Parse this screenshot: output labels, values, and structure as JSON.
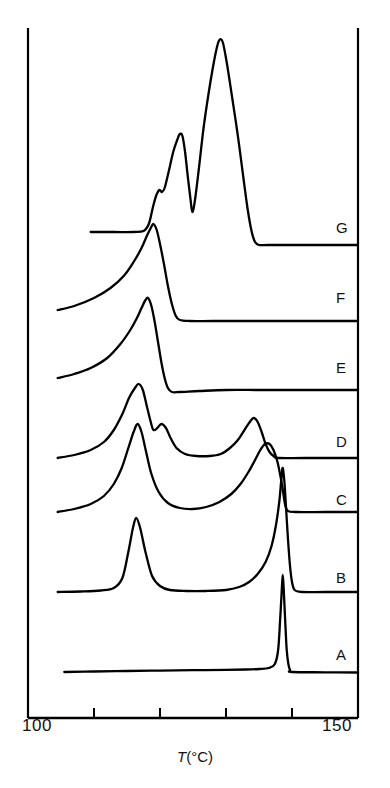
{
  "chart_data": {
    "type": "line",
    "title": "",
    "subtitle": "",
    "xlabel": "T(°C)",
    "xlabel_symbol": "T",
    "xlabel_units": "(°C)",
    "ylabel": "",
    "xlim": [
      100,
      150
    ],
    "ylim": [
      0,
      1
    ],
    "grid": false,
    "legend_position": "right-inline",
    "xticks": [
      100,
      110,
      120,
      130,
      140,
      150
    ],
    "xtick_labels": [
      "100",
      "",
      "",
      "",
      "",
      "150"
    ],
    "axis_style": "open-frame-left-right-bottom",
    "line_color": "#000000",
    "background_color": "#ffffff",
    "annotations": [
      "A",
      "B",
      "C",
      "D",
      "E",
      "F",
      "G"
    ],
    "series": [
      {
        "name": "A",
        "label": "A",
        "baseline_y": 672,
        "label_y": 655,
        "description": "flat baseline with single very sharp endothermic peak near 139 °C",
        "points": [
          [
            105.5,
            672
          ],
          [
            110,
            671.5
          ],
          [
            115,
            671
          ],
          [
            120,
            670.6
          ],
          [
            125,
            670.2
          ],
          [
            130,
            669.8
          ],
          [
            133,
            669.5
          ],
          [
            135,
            669.0
          ],
          [
            136.5,
            668.0
          ],
          [
            137.4,
            664.0
          ],
          [
            137.9,
            650.0
          ],
          [
            138.2,
            620.0
          ],
          [
            138.45,
            590.0
          ],
          [
            138.6,
            575.0
          ],
          [
            138.75,
            590.0
          ],
          [
            139.0,
            625.0
          ],
          [
            139.2,
            650.0
          ],
          [
            139.45,
            664.0
          ],
          [
            139.7,
            670.0
          ],
          [
            140.0,
            672.0
          ],
          [
            145,
            672.3
          ],
          [
            150,
            672.5
          ]
        ]
      },
      {
        "name": "B",
        "label": "B",
        "baseline_y": 592,
        "label_y": 578,
        "description": "broad small peak near 116 °C then rising shoulder to sharp peak near 139 °C",
        "points": [
          [
            104.5,
            592
          ],
          [
            108,
            591.5
          ],
          [
            111,
            590.5
          ],
          [
            113,
            588
          ],
          [
            114.3,
            578
          ],
          [
            115.2,
            552
          ],
          [
            115.9,
            528
          ],
          [
            116.4,
            518
          ],
          [
            117.0,
            528
          ],
          [
            117.8,
            552
          ],
          [
            118.8,
            576
          ],
          [
            120,
            586
          ],
          [
            121.5,
            590
          ],
          [
            124,
            591
          ],
          [
            127,
            591
          ],
          [
            130,
            590
          ],
          [
            132,
            587
          ],
          [
            133.5,
            582
          ],
          [
            134.8,
            574
          ],
          [
            136,
            562
          ],
          [
            136.9,
            546
          ],
          [
            137.6,
            524
          ],
          [
            138.1,
            500
          ],
          [
            138.4,
            478
          ],
          [
            138.6,
            468
          ],
          [
            138.85,
            482
          ],
          [
            139.1,
            508
          ],
          [
            139.4,
            540
          ],
          [
            139.7,
            566
          ],
          [
            140.0,
            582
          ],
          [
            140.4,
            590
          ],
          [
            141.5,
            592
          ],
          [
            145,
            592
          ],
          [
            150,
            592
          ]
        ]
      },
      {
        "name": "C",
        "label": "C",
        "baseline_y": 512,
        "label_y": 500,
        "description": "broad asymmetric endotherm near 117 °C with long tail then very sharp peak near 139 °C",
        "points": [
          [
            104.5,
            512
          ],
          [
            107,
            509
          ],
          [
            109.5,
            504
          ],
          [
            111.5,
            496
          ],
          [
            113,
            484
          ],
          [
            114.2,
            468
          ],
          [
            115.2,
            448
          ],
          [
            116.0,
            432
          ],
          [
            116.6,
            424
          ],
          [
            117.2,
            432
          ],
          [
            117.9,
            452
          ],
          [
            118.7,
            474
          ],
          [
            119.8,
            492
          ],
          [
            121.2,
            503
          ],
          [
            123,
            508
          ],
          [
            125,
            509
          ],
          [
            127,
            507
          ],
          [
            129,
            502
          ],
          [
            130.8,
            494
          ],
          [
            132.2,
            484
          ],
          [
            133.4,
            472
          ],
          [
            134.4,
            460
          ],
          [
            135.2,
            450
          ],
          [
            135.9,
            444
          ],
          [
            136.6,
            444
          ],
          [
            137.2,
            450
          ],
          [
            137.8,
            462
          ],
          [
            138.3,
            478
          ],
          [
            138.7,
            494
          ],
          [
            139.0,
            506
          ],
          [
            139.4,
            511
          ],
          [
            140.5,
            512
          ],
          [
            145,
            512
          ],
          [
            150,
            512
          ]
        ]
      },
      {
        "name": "D",
        "label": "D",
        "baseline_y": 458,
        "label_y": 442,
        "description": "sharp main peak near 117 °C with secondary shoulder near 120 °C and broad peak near 133 °C",
        "points": [
          [
            104.5,
            458
          ],
          [
            107,
            455
          ],
          [
            109.5,
            450
          ],
          [
            111.5,
            442
          ],
          [
            113,
            430
          ],
          [
            114.3,
            414
          ],
          [
            115.3,
            398
          ],
          [
            116.2,
            388
          ],
          [
            116.8,
            384
          ],
          [
            117.4,
            390
          ],
          [
            118.0,
            406
          ],
          [
            118.6,
            422
          ],
          [
            119.0,
            430
          ],
          [
            119.6,
            428
          ],
          [
            120.2,
            424
          ],
          [
            120.9,
            428
          ],
          [
            121.6,
            438
          ],
          [
            122.5,
            448
          ],
          [
            123.8,
            454
          ],
          [
            125.5,
            456
          ],
          [
            127.5,
            456
          ],
          [
            129.2,
            454
          ],
          [
            130.6,
            448
          ],
          [
            131.8,
            440
          ],
          [
            132.8,
            430
          ],
          [
            133.6,
            422
          ],
          [
            134.2,
            418
          ],
          [
            134.8,
            422
          ],
          [
            135.4,
            432
          ],
          [
            136.0,
            444
          ],
          [
            136.6,
            452
          ],
          [
            137.2,
            456
          ],
          [
            138,
            458
          ],
          [
            142,
            458
          ],
          [
            150,
            458
          ]
        ]
      },
      {
        "name": "E",
        "label": "E",
        "baseline_y": 378,
        "label_y": 368,
        "description": "broad leading edge rising to sharp peak near 118 °C then sharp drop to flat baseline",
        "points": [
          [
            104.5,
            378
          ],
          [
            107,
            374
          ],
          [
            109.5,
            368
          ],
          [
            112,
            358
          ],
          [
            114,
            344
          ],
          [
            115.5,
            330
          ],
          [
            116.5,
            318
          ],
          [
            117.2,
            308
          ],
          [
            117.8,
            300
          ],
          [
            118.2,
            298
          ],
          [
            118.7,
            306
          ],
          [
            119.2,
            322
          ],
          [
            119.7,
            342
          ],
          [
            120.2,
            362
          ],
          [
            120.7,
            378
          ],
          [
            121.2,
            388
          ],
          [
            121.8,
            392
          ],
          [
            123,
            392
          ],
          [
            126,
            391
          ],
          [
            130,
            390
          ],
          [
            135,
            390
          ],
          [
            140,
            390
          ],
          [
            145,
            390
          ],
          [
            150,
            390
          ]
        ]
      },
      {
        "name": "F",
        "label": "F",
        "baseline_y": 310,
        "label_y": 298,
        "description": "broad shoulder rising to sharp peak near 119 °C then drop to flat baseline",
        "points": [
          [
            104.5,
            310
          ],
          [
            107,
            306
          ],
          [
            110,
            298
          ],
          [
            112.5,
            288
          ],
          [
            114.5,
            276
          ],
          [
            116,
            262
          ],
          [
            117.2,
            248
          ],
          [
            118.0,
            236
          ],
          [
            118.6,
            228
          ],
          [
            119.0,
            224
          ],
          [
            119.5,
            230
          ],
          [
            120.0,
            244
          ],
          [
            120.6,
            264
          ],
          [
            121.2,
            286
          ],
          [
            121.8,
            304
          ],
          [
            122.4,
            316
          ],
          [
            123.0,
            320
          ],
          [
            124.5,
            321
          ],
          [
            128,
            321
          ],
          [
            134,
            321
          ],
          [
            140,
            321
          ],
          [
            145,
            321
          ],
          [
            150,
            321
          ]
        ]
      },
      {
        "name": "G",
        "label": "G",
        "baseline_y": 232,
        "label_y": 228,
        "description": "flat baseline then steep rise with small shoulder near 120 °C, peak near 122 °C, dip, then very tall sharp peak near 131 °C",
        "points": [
          [
            109.5,
            232
          ],
          [
            113,
            232
          ],
          [
            116,
            232
          ],
          [
            117.5,
            231
          ],
          [
            118.3,
            224
          ],
          [
            118.9,
            208
          ],
          [
            119.4,
            196
          ],
          [
            119.9,
            190
          ],
          [
            120.3,
            192
          ],
          [
            120.7,
            188
          ],
          [
            121.3,
            172
          ],
          [
            122.0,
            152
          ],
          [
            122.6,
            140
          ],
          [
            123.0,
            134
          ],
          [
            123.4,
            136
          ],
          [
            123.8,
            152
          ],
          [
            124.2,
            176
          ],
          [
            124.6,
            198
          ],
          [
            124.9,
            212
          ],
          [
            125.3,
            200
          ],
          [
            125.9,
            168
          ],
          [
            126.6,
            128
          ],
          [
            127.3,
            96
          ],
          [
            128.0,
            68
          ],
          [
            128.6,
            48
          ],
          [
            129.0,
            40
          ],
          [
            129.5,
            42
          ],
          [
            130.1,
            62
          ],
          [
            130.9,
            96
          ],
          [
            131.8,
            136
          ],
          [
            132.6,
            176
          ],
          [
            133.3,
            210
          ],
          [
            133.9,
            232
          ],
          [
            134.4,
            242
          ],
          [
            135.0,
            245
          ],
          [
            136.5,
            245
          ],
          [
            140,
            245
          ],
          [
            145,
            245
          ],
          [
            150,
            245
          ]
        ]
      }
    ]
  },
  "axis": {
    "min_label": "100",
    "max_label": "150",
    "title_symbol": "T",
    "title_units": "(°C)"
  },
  "labels": {
    "a": "A",
    "b": "B",
    "c": "C",
    "d": "D",
    "e": "E",
    "f": "F",
    "g": "G"
  }
}
